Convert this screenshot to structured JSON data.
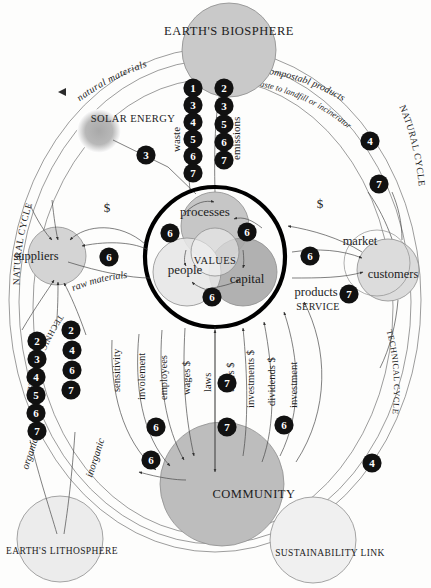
{
  "diagram": {
    "nodes": {
      "biosphere": "EARTH'S BIOSPHERE",
      "lithosphere": "EARTH'S LITHOSPHERE",
      "solar": "SOLAR ENERGY",
      "community": "COMMUNITY",
      "sustainability": "SUSTAINABILITY LINK",
      "suppliers": "suppliers",
      "customers": "customers",
      "market": "market",
      "processes": "processes",
      "people": "people",
      "capital": "capital",
      "values": "VALUES"
    },
    "cycles": {
      "natural_left": "NATURAL CYCLE",
      "natural_right": "NATURAL CYCLE",
      "technical_left": "TECHNICAL CYCLE",
      "technical_right": "TECHNICAL CYCLE"
    },
    "flows": {
      "natural_materials": "natural materials",
      "compostable": "compostabl products",
      "waste_landfill": "waste to landfill or incinerator",
      "waste": "waste",
      "emissions": "emissions",
      "raw_materials": "raw materials",
      "products": "products",
      "service": "SERVICE",
      "money_left": "$",
      "money_right": "$",
      "organic": "organic",
      "inorganic": "inorganic"
    },
    "community_flows": [
      "sensitivity",
      "involement",
      "employees",
      "wages $",
      "laws",
      "taxes $",
      "investments $",
      "dividends $",
      "investment"
    ],
    "badges": {
      "waste_column": [
        "1",
        "3",
        "4",
        "5",
        "6",
        "7"
      ],
      "emissions_column": [
        "2",
        "3",
        "5",
        "6",
        "7"
      ],
      "natural_cycle_right": [
        "4",
        "7"
      ],
      "technical_cycle_left_inner": [
        "2",
        "3",
        "4",
        "5",
        "6",
        "7"
      ],
      "technical_cycle_left_outer": [
        "2",
        "4",
        "6",
        "7"
      ],
      "technical_cycle_right": [
        "4"
      ],
      "solar": [
        "3"
      ],
      "suppliers_link": [
        "6"
      ],
      "core_processes_left": [
        "6"
      ],
      "core_processes_right": [
        "6"
      ],
      "core_capital_bottom": [
        "6"
      ],
      "market_link": [
        "6"
      ],
      "customers_link": [
        "7"
      ],
      "community_left": [
        "6",
        "6"
      ],
      "community_center": [
        "7",
        "7"
      ],
      "community_right": [
        "6"
      ]
    },
    "colors": {
      "biosphere_fill": "#c9c9c9",
      "community_fill": "#bdbdbd",
      "processes_fill": "#c0c0c0",
      "capital_fill": "#a8a8a8",
      "people_fill": "#e6e6e6",
      "values_fill": "#f2f2f2",
      "suppliers_fill": "#d4d4d4",
      "customers_fill": "#dcdcdc",
      "lithosphere_fill": "#ececec",
      "solar_fill": "#b4b4b4",
      "badge_fill": "#111111",
      "badge_text": "#ffffff",
      "line": "#4a4a4a",
      "core_ring": "#000000"
    }
  }
}
